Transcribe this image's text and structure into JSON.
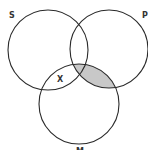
{
  "diagram": {
    "type": "venn",
    "sets": [
      {
        "id": "S",
        "label": "S",
        "cx": 48,
        "cy": 50,
        "r": 40
      },
      {
        "id": "P",
        "label": "P",
        "cx": 109,
        "cy": 49,
        "r": 39
      },
      {
        "id": "M",
        "label": "M",
        "cx": 79,
        "cy": 104,
        "r": 40
      }
    ],
    "shaded_region": "P ∩ M",
    "marks": [
      {
        "label": "X",
        "region": "S ∩ M (outside P)"
      }
    ],
    "colors": {
      "stroke": "#2a2a2a",
      "shade": "#c8c8c8",
      "background": "#ffffff"
    }
  }
}
